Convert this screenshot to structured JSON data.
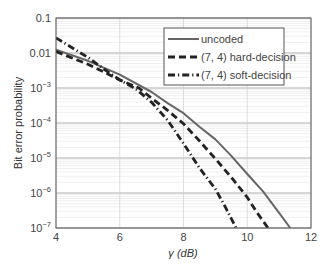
{
  "chart_data": {
    "type": "line",
    "title": "",
    "xlabel": "γ (dB)",
    "ylabel": "Bit error probability",
    "xscale": "linear",
    "yscale": "log",
    "xlim": [
      4,
      12
    ],
    "ylim": [
      1e-07,
      0.1
    ],
    "xticks": [
      4,
      6,
      8,
      10,
      12
    ],
    "xtick_labels": [
      "4",
      "6",
      "8",
      "10",
      "12"
    ],
    "yticks": [
      1e-07,
      1e-06,
      1e-05,
      0.0001,
      0.001,
      0.01,
      0.1
    ],
    "ytick_labels": [
      {
        "base": "10",
        "exp": "−7"
      },
      {
        "base": "10",
        "exp": "−6"
      },
      {
        "base": "10",
        "exp": "−5"
      },
      {
        "base": "10",
        "exp": "−4"
      },
      {
        "base": "10",
        "exp": "−3"
      },
      {
        "base": "0.01",
        "exp": ""
      },
      {
        "base": "0.1",
        "exp": ""
      }
    ],
    "grid": {
      "major": true,
      "minor": true
    },
    "legend_position": "upper right",
    "series": [
      {
        "name": "uncoded",
        "style": "solid",
        "color": "#666666",
        "x": [
          4,
          5,
          6,
          7,
          7.5,
          8,
          8.5,
          9,
          9.5,
          10,
          10.5,
          11,
          11.35
        ],
        "y": [
          0.0125,
          0.006,
          0.0024,
          0.00077,
          0.00037,
          0.00019,
          7.8e-05,
          3.4e-05,
          1.15e-05,
          3.5e-06,
          1.1e-06,
          2.7e-07,
          1e-07
        ]
      },
      {
        "name": "(7, 4) hard-decision",
        "style": "dashed",
        "color": "#222222",
        "x": [
          4,
          5,
          6,
          6.6,
          7,
          7.5,
          8,
          8.5,
          9,
          9.5,
          10,
          10.3,
          10.65
        ],
        "y": [
          0.011,
          0.0048,
          0.0017,
          0.001,
          0.00051,
          0.00023,
          9.5e-05,
          3.1e-05,
          9.5e-06,
          2.8e-06,
          7.5e-07,
          2.8e-07,
          1e-07
        ]
      },
      {
        "name": "(7, 4) soft-decision",
        "style": "dash-dot",
        "color": "#222222",
        "x": [
          4,
          5,
          5.5,
          6,
          6.5,
          7,
          7.5,
          8,
          8.5,
          9,
          9.3,
          9.65
        ],
        "y": [
          0.027,
          0.0075,
          0.0035,
          0.0017,
          0.00095,
          0.00039,
          0.00012,
          2.6e-05,
          5.2e-06,
          1.3e-06,
          4.2e-07,
          1e-07
        ]
      }
    ]
  }
}
